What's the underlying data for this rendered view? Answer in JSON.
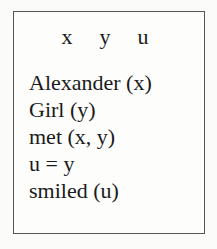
{
  "drs": {
    "referents": [
      "x",
      "y",
      "u"
    ],
    "conditions": [
      "Alexander (x)",
      "Girl (y)",
      "met (x, y)",
      "u = y",
      "smiled (u)"
    ]
  }
}
